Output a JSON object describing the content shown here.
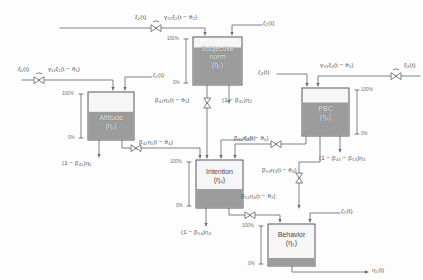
{
  "diagram": {
    "stroke_color": "#6b6c70",
    "tank_fill_color": "#9a9a9a",
    "tank_empty_color": "#f4f4f4"
  },
  "tanks": [
    {
      "id": "attitude",
      "name": "Attitude",
      "symbol": "(η₁)",
      "level_pct": 60,
      "scale_top": "100%",
      "scale_bottom": "0%"
    },
    {
      "id": "subjective",
      "name": "Subjective",
      "name2": "norm",
      "symbol": "(η₂)",
      "level_pct": 78,
      "scale_top": "100%",
      "scale_bottom": "0%"
    },
    {
      "id": "pbc",
      "name": "PBC",
      "symbol": "(η₃)",
      "level_pct": 70,
      "scale_top": "100%",
      "scale_bottom": "0%"
    },
    {
      "id": "intention",
      "name": "Intention",
      "symbol": "(η₄)",
      "level_pct": 38,
      "scale_top": "100%",
      "scale_bottom": "0%"
    },
    {
      "id": "behavior",
      "name": "Behavior",
      "symbol": "(η₅)",
      "level_pct": 18,
      "scale_top": "100%",
      "scale_bottom": "0%"
    }
  ],
  "exogenous_inputs": [
    {
      "id": "xi1",
      "source_label": "ξ₁(t)",
      "flow_label": "γ₁₁ξ₁(t − θ₁)",
      "target": "attitude"
    },
    {
      "id": "xi2",
      "source_label": "ξ₂(t)",
      "flow_label": "γ₂₂ξ₂(t − θ₂)",
      "target": "subjective"
    },
    {
      "id": "xi3",
      "source_label": "ξ₃(t)",
      "flow_label": "γ₃₃ξ₃(t − θ₃)",
      "target": "pbc"
    }
  ],
  "disturbances": [
    {
      "id": "zeta1",
      "label": "ζ₁(t)",
      "target": "attitude"
    },
    {
      "id": "zeta2",
      "label": "ζ₂(t)",
      "target": "subjective"
    },
    {
      "id": "zeta3",
      "label": "ζ₃(t)",
      "target": "pbc"
    },
    {
      "id": "zeta4",
      "label": "ζ₄(t)",
      "target": "intention"
    },
    {
      "id": "zeta5",
      "label": "ζ₅(t)",
      "target": "behavior"
    }
  ],
  "flows": [
    {
      "id": "b41",
      "label": "β₄₁η₁(t − θ₄)",
      "from": "attitude",
      "to": "intention"
    },
    {
      "id": "b42",
      "label": "β₄₂η₂(t − θ₅)",
      "from": "subjective",
      "to": "intention"
    },
    {
      "id": "b43",
      "label": "β₄₃η₃(t − θ₆)",
      "from": "pbc",
      "to": "intention"
    },
    {
      "id": "b54",
      "label": "β₅₄η₄(t − θ₇)",
      "from": "intention",
      "to": "behavior"
    },
    {
      "id": "b53",
      "label": "β₅₃η₃(t − θ₈)",
      "from": "pbc",
      "to": "behavior"
    }
  ],
  "losses": [
    {
      "id": "loss_attitude",
      "label": "(1 − β₄₁)η₁"
    },
    {
      "id": "loss_subjective",
      "label": "(1 − β₄₂)η₂"
    },
    {
      "id": "loss_pbc",
      "label": "(1 − β₄₃ − β₅₃)η₃"
    },
    {
      "id": "loss_intention",
      "label": "(1 − β₅₄)η₄"
    }
  ],
  "output": {
    "id": "eta5_out",
    "label": "η₅(t)"
  }
}
